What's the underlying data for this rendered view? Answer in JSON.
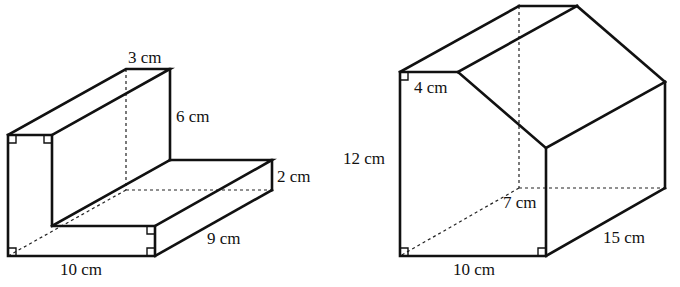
{
  "figures": [
    {
      "id": "l-prism",
      "shape": "L-shaped prism",
      "labels": {
        "top_width": "3 cm",
        "upright_height": "6 cm",
        "step_height": "2 cm",
        "depth": "9 cm",
        "base_length": "10 cm"
      }
    },
    {
      "id": "house-prism",
      "shape": "pentagonal (house-shaped) prism",
      "labels": {
        "top_flat": "4 cm",
        "left_height": "12 cm",
        "right_height": "7 cm",
        "depth": "15 cm",
        "base_length": "10 cm"
      }
    }
  ],
  "colors": {
    "line": "#111111",
    "background": "#ffffff"
  }
}
